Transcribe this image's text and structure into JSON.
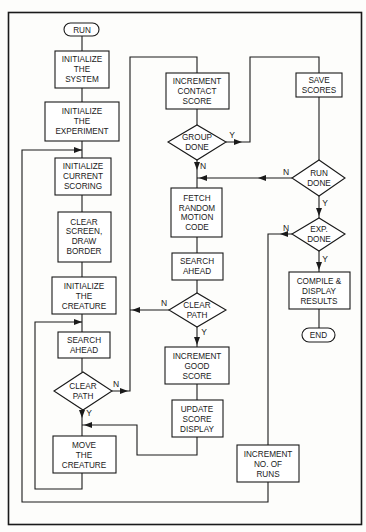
{
  "diagram": {
    "type": "flowchart",
    "nodes": {
      "run": {
        "kind": "terminal",
        "lines": [
          "RUN"
        ]
      },
      "init_system": {
        "kind": "process",
        "lines": [
          "INITIALIZE",
          "THE",
          "SYSTEM"
        ]
      },
      "init_experiment": {
        "kind": "process",
        "lines": [
          "INITIALIZE",
          "THE",
          "EXPERIMENT"
        ]
      },
      "init_scoring": {
        "kind": "process",
        "lines": [
          "INITIALIZE",
          "CURRENT",
          "SCORING"
        ]
      },
      "clear_screen": {
        "kind": "process",
        "lines": [
          "CLEAR",
          "SCREEN,",
          "DRAW",
          "BORDER"
        ]
      },
      "init_creature": {
        "kind": "process",
        "lines": [
          "INITIALIZE",
          "THE",
          "CREATURE"
        ]
      },
      "search_ahead_1": {
        "kind": "process",
        "lines": [
          "SEARCH",
          "AHEAD"
        ]
      },
      "clear_path_1": {
        "kind": "decision",
        "lines": [
          "CLEAR",
          "PATH"
        ]
      },
      "move_creature": {
        "kind": "process",
        "lines": [
          "MOVE",
          "THE",
          "CREATURE"
        ]
      },
      "inc_contact": {
        "kind": "process",
        "lines": [
          "INCREMENT",
          "CONTACT",
          "SCORE"
        ]
      },
      "group_done": {
        "kind": "decision",
        "lines": [
          "GROUP",
          "DONE"
        ]
      },
      "fetch_random": {
        "kind": "process",
        "lines": [
          "FETCH",
          "RANDOM",
          "MOTION",
          "CODE"
        ]
      },
      "search_ahead_2": {
        "kind": "process",
        "lines": [
          "SEARCH",
          "AHEAD"
        ]
      },
      "clear_path_2": {
        "kind": "decision",
        "lines": [
          "CLEAR",
          "PATH"
        ]
      },
      "inc_good": {
        "kind": "process",
        "lines": [
          "INCREMENT",
          "GOOD",
          "SCORE"
        ]
      },
      "update_display": {
        "kind": "process",
        "lines": [
          "UPDATE",
          "SCORE",
          "DISPLAY"
        ]
      },
      "save_scores": {
        "kind": "process",
        "lines": [
          "SAVE",
          "SCORES"
        ]
      },
      "run_done": {
        "kind": "decision",
        "lines": [
          "RUN",
          "DONE"
        ]
      },
      "exp_done": {
        "kind": "decision",
        "lines": [
          "EXP.",
          "DONE"
        ]
      },
      "compile": {
        "kind": "process",
        "lines": [
          "COMPILE &",
          "DISPLAY",
          "RESULTS"
        ]
      },
      "end": {
        "kind": "terminal",
        "lines": [
          "END"
        ]
      },
      "inc_runs": {
        "kind": "process",
        "lines": [
          "INCREMENT",
          "NO. OF",
          "RUNS"
        ]
      }
    },
    "edge_labels": {
      "yes": "Y",
      "no": "N"
    },
    "edges": [
      {
        "from": "run",
        "to": "init_system"
      },
      {
        "from": "init_system",
        "to": "init_experiment"
      },
      {
        "from": "init_experiment",
        "to": "init_scoring"
      },
      {
        "from": "init_scoring",
        "to": "clear_screen"
      },
      {
        "from": "clear_screen",
        "to": "init_creature"
      },
      {
        "from": "init_creature",
        "to": "search_ahead_1"
      },
      {
        "from": "search_ahead_1",
        "to": "clear_path_1"
      },
      {
        "from": "clear_path_1",
        "to": "move_creature",
        "label": "Y"
      },
      {
        "from": "clear_path_1",
        "to": "inc_contact",
        "label": "N"
      },
      {
        "from": "move_creature",
        "to": "search_ahead_1"
      },
      {
        "from": "inc_contact",
        "to": "group_done"
      },
      {
        "from": "group_done",
        "to": "fetch_random",
        "label": "N"
      },
      {
        "from": "group_done",
        "to": "save_scores",
        "label": "Y"
      },
      {
        "from": "fetch_random",
        "to": "search_ahead_2"
      },
      {
        "from": "search_ahead_2",
        "to": "clear_path_2"
      },
      {
        "from": "clear_path_2",
        "to": "inc_contact",
        "label": "N"
      },
      {
        "from": "clear_path_2",
        "to": "inc_good",
        "label": "Y"
      },
      {
        "from": "inc_good",
        "to": "update_display"
      },
      {
        "from": "update_display",
        "to": "move_creature"
      },
      {
        "from": "save_scores",
        "to": "run_done"
      },
      {
        "from": "run_done",
        "to": "fetch_random",
        "label": "N"
      },
      {
        "from": "run_done",
        "to": "exp_done",
        "label": "Y"
      },
      {
        "from": "exp_done",
        "to": "inc_runs",
        "label": "N"
      },
      {
        "from": "exp_done",
        "to": "compile",
        "label": "Y"
      },
      {
        "from": "inc_runs",
        "to": "init_scoring"
      },
      {
        "from": "compile",
        "to": "end"
      }
    ]
  }
}
